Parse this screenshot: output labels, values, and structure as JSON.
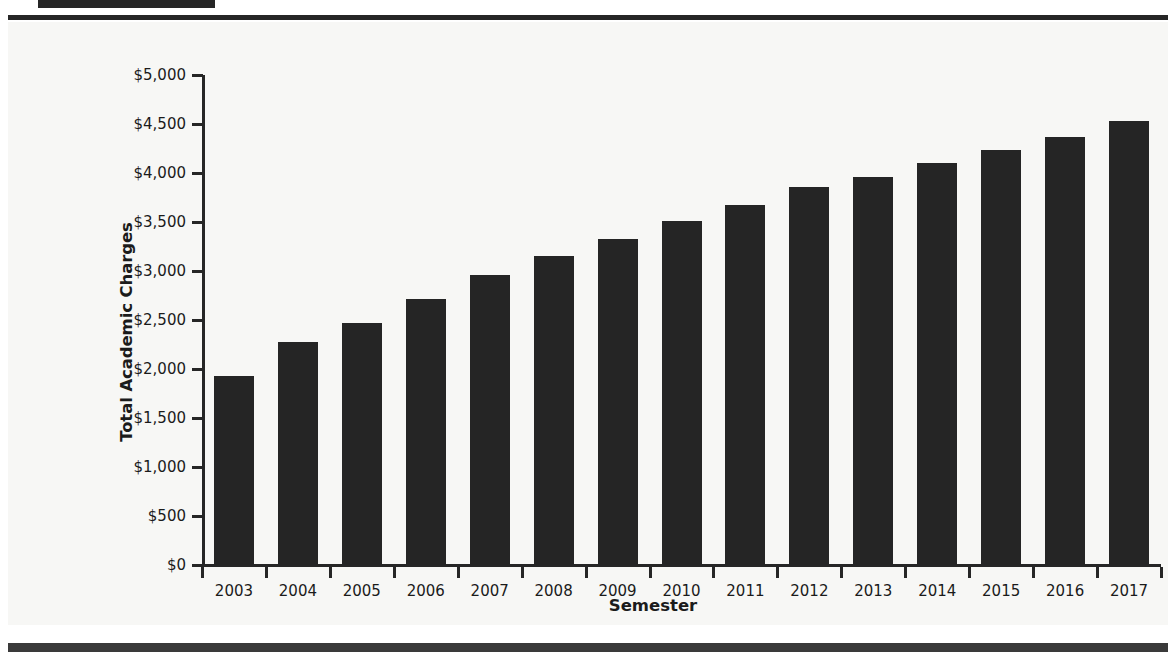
{
  "page": {
    "background_color": "#ffffff",
    "panel_color": "#f7f7f5",
    "rule_color": "#262626",
    "footer_rule_color": "#3a3a3a"
  },
  "header": {
    "tab_block_color": "#262626"
  },
  "chart_data": {
    "type": "bar",
    "title": "",
    "xlabel": "Semester",
    "ylabel": "Total Academic Charges",
    "categories": [
      "2003",
      "2004",
      "2005",
      "2006",
      "2007",
      "2008",
      "2009",
      "2010",
      "2011",
      "2012",
      "2013",
      "2014",
      "2015",
      "2016",
      "2017"
    ],
    "values": [
      1930,
      2280,
      2465,
      2715,
      2960,
      3150,
      3325,
      3510,
      3675,
      3855,
      3960,
      4100,
      4230,
      4370,
      4535
    ],
    "ylim": [
      0,
      5000
    ],
    "ytick_values": [
      0,
      500,
      1000,
      1500,
      2000,
      2500,
      3000,
      3500,
      4000,
      4500,
      5000
    ],
    "ytick_labels": [
      "$0",
      "$500",
      "$1,000",
      "$1,500",
      "$2,000",
      "$2,500",
      "$3,000",
      "$3,500",
      "$4,000",
      "$4,500",
      "$5,000"
    ],
    "grid": false,
    "legend": null,
    "bar_color": "#252525",
    "axis_color": "#262626"
  }
}
